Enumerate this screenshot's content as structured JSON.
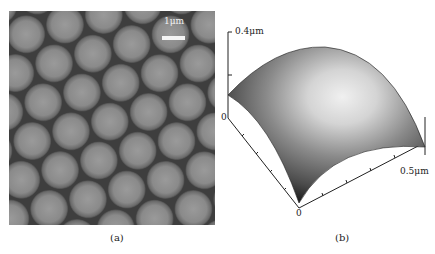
{
  "figure": {
    "panels": [
      {
        "id": "a",
        "caption": "(a)",
        "type": "micrograph",
        "description": "Top-view image of hexagonally close-packed spheres",
        "scale_bar": {
          "label": "1μm",
          "color": "#f4f4f4"
        }
      },
      {
        "id": "b",
        "caption": "(b)",
        "type": "3d-surface",
        "description": "3D AFM-style height map of a single sphere cap",
        "axes": {
          "z_max_label": "0.4μm",
          "z_origin_label": "0",
          "origin_label": "0",
          "x_max_label": "0.5μm"
        }
      }
    ]
  },
  "colors": {
    "background": "#ffffff",
    "sphere_fill": "#8c8c8c",
    "gap_fill": "#3a3a3a",
    "surface_dark": "#2a2a2a",
    "surface_light": "#e8e8e8"
  }
}
